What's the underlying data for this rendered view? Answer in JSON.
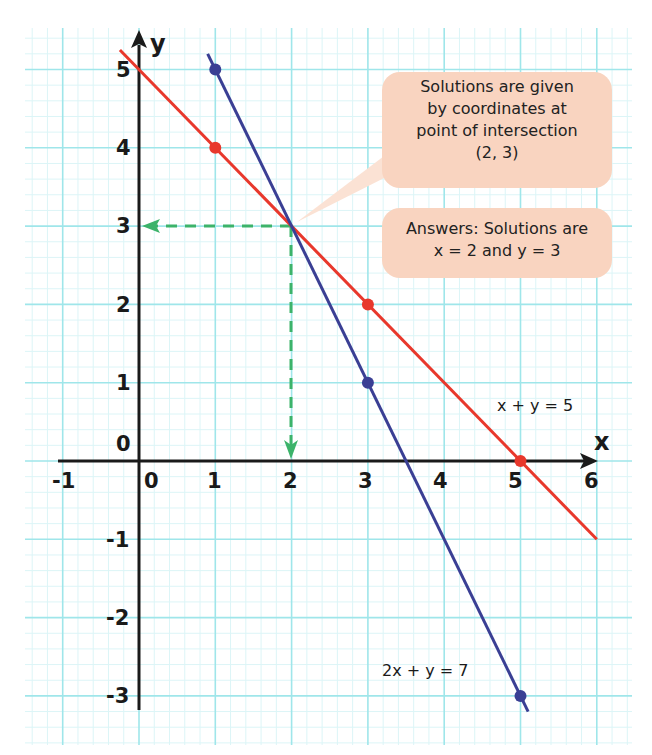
{
  "chart_data": {
    "type": "line",
    "title": "",
    "xlabel": "x",
    "ylabel": "y",
    "xlim": [
      -1,
      6
    ],
    "ylim": [
      -3,
      5
    ],
    "grid": true,
    "x_ticks": [
      "-1",
      "0",
      "1",
      "2",
      "3",
      "4",
      "5",
      "6"
    ],
    "y_ticks": [
      "5",
      "4",
      "3",
      "2",
      "1",
      "0",
      "-1",
      "-2",
      "-3"
    ],
    "series": [
      {
        "name": "x + y = 5",
        "color": "#e8382c",
        "points": [
          [
            0,
            5
          ],
          [
            1,
            4
          ],
          [
            3,
            2
          ],
          [
            5,
            0
          ]
        ],
        "marked_points": [
          [
            1,
            4
          ],
          [
            3,
            2
          ],
          [
            5,
            0
          ]
        ],
        "line_extent_x": [
          -0.25,
          6.0
        ]
      },
      {
        "name": "2x + y = 7",
        "color": "#3a3f94",
        "points": [
          [
            1,
            5
          ],
          [
            3,
            1
          ],
          [
            5,
            -3
          ]
        ],
        "marked_points": [
          [
            1,
            5
          ],
          [
            3,
            1
          ],
          [
            5,
            -3
          ]
        ],
        "line_extent_x": [
          0.9,
          5.1
        ]
      }
    ],
    "intersection": [
      2,
      3
    ],
    "annotations": [
      "Solutions are given by coordinates at point of intersection (2, 3)",
      "Answers: Solutions are x = 2 and y = 3"
    ]
  },
  "labels": {
    "y_axis": "y",
    "x_axis": "x",
    "origin": "0",
    "eq_red": "x + y = 5",
    "eq_blue": "2x + y = 7"
  },
  "callout_top": {
    "line1": "Solutions are given",
    "line2": "by coordinates at",
    "line3": "point of intersection",
    "line4": "(2, 3)"
  },
  "callout_bottom": {
    "line1": "Answers: Solutions are",
    "line2": "x = 2 and y = 3"
  },
  "colors": {
    "grid_major": "#9fe6ea",
    "grid_minor": "#dcf5f7",
    "red_line": "#e8382c",
    "blue_line": "#3a3f94",
    "guide": "#3cb36a",
    "callout_bg": "#f9d4c0"
  }
}
